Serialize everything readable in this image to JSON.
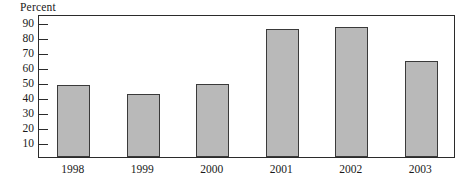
{
  "chart_data": {
    "type": "bar",
    "title": "",
    "ylabel": "Percent",
    "xlabel": "",
    "categories": [
      "1998",
      "1999",
      "2000",
      "2001",
      "2002",
      "2003"
    ],
    "values": [
      48,
      42,
      48.5,
      85,
      86.5,
      64
    ],
    "ylim": [
      0,
      95
    ],
    "yticks": [
      10,
      20,
      30,
      40,
      50,
      60,
      70,
      80,
      90
    ],
    "ytick_labels": [
      "10",
      "20",
      "30",
      "40",
      "50",
      "60",
      "70",
      "80",
      "90"
    ],
    "grid": false,
    "legend": null,
    "colors": {
      "bar_fill": "#b9b9b9",
      "bar_border": "#3a3a3a",
      "frame": "#2b2b2b",
      "text": "#1a1a1a",
      "background": "#ffffff"
    }
  }
}
